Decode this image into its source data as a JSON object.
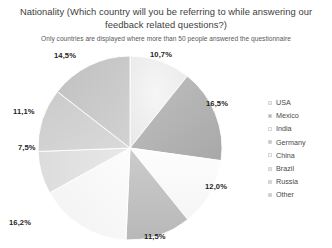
{
  "chart_data": {
    "type": "pie",
    "title": "Nationality  (Which country will you be referring to while answering our feedback related questions?)",
    "subtitle": "Only countries are displayed where more than 50 people answered the questionnaire",
    "xlabel": "",
    "ylabel": "",
    "legend_position": "right",
    "grid": false,
    "categories": [
      "USA",
      "Mexico",
      "India",
      "Germany",
      "China",
      "Brazil",
      "Russia",
      "Other"
    ],
    "values": [
      10.7,
      16.5,
      12.0,
      11.5,
      16.2,
      7.5,
      11.1,
      14.5
    ],
    "value_labels": [
      "10,7%",
      "16,5%",
      "12,0%",
      "11,5%",
      "16,2%",
      "7,5%",
      "11,1%",
      "14,5%"
    ],
    "slice_colors": [
      "#ededed",
      "#b3b3b3",
      "#fbfbfb",
      "#c2c2c2",
      "#fafafa",
      "#e2e2e2",
      "#d2d2d2",
      "#c9c9c9"
    ],
    "start_angle_deg": 0,
    "direction": "clockwise"
  },
  "legend": {
    "items": [
      {
        "label": "USA",
        "color": "#ededed"
      },
      {
        "label": "Mexico",
        "color": "#b3b3b3"
      },
      {
        "label": "India",
        "color": "#fbfbfb"
      },
      {
        "label": "Germany",
        "color": "#c2c2c2"
      },
      {
        "label": "China",
        "color": "#fafafa"
      },
      {
        "label": "Brazil",
        "color": "#e2e2e2"
      },
      {
        "label": "Russia",
        "color": "#d2d2d2"
      },
      {
        "label": "Other",
        "color": "#c9c9c9"
      }
    ]
  },
  "labels": {
    "usa": "10,7%",
    "mexico": "16,5%",
    "india": "12,0%",
    "germany": "11,5%",
    "china": "16,2%",
    "brazil": "7,5%",
    "russia": "11,1%",
    "other": "14,5%"
  }
}
